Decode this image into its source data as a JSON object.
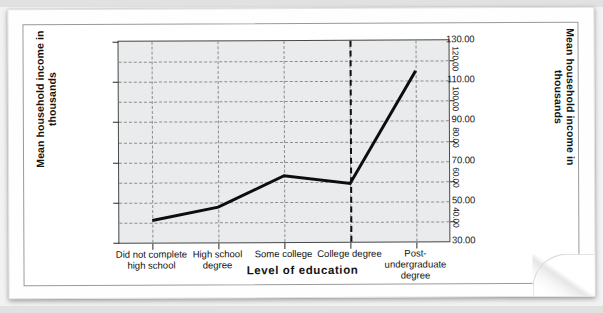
{
  "figure": {
    "x_axis_title": "Level of education",
    "y_axis_title_left": "Mean household income in\nthousands",
    "y_axis_title_right": "Mean household income in\nthousands"
  },
  "chart_data": {
    "type": "line",
    "title": "",
    "xlabel": "Level of education",
    "ylabel": "Mean household income in thousands",
    "categories": [
      "Did not complete\nhigh school",
      "High school\ndegree",
      "Some college",
      "College degree",
      "Post-\nundergraduate\ndegree"
    ],
    "values": [
      41.0,
      47.5,
      63.0,
      59.0,
      115.0
    ],
    "ylim": [
      30,
      130
    ],
    "yticks": [
      30,
      50,
      70,
      90,
      110,
      130
    ],
    "ytick_labels": [
      "30.00",
      "50.00",
      "70.00",
      "90.00",
      "110.00",
      "130.00"
    ],
    "y_minor_gridlines": [
      40,
      60,
      80,
      100,
      120
    ],
    "right_axis": {
      "ticks": [
        40,
        60,
        80,
        100,
        120
      ],
      "tick_labels": [
        "40.00",
        "60.00",
        "80.00",
        "100.00",
        "120.00"
      ],
      "label": "Mean household income in thousands"
    },
    "grid": true,
    "legend": "none",
    "annotations": [
      {
        "type": "vertical-reference-line",
        "at_category": "College degree",
        "style": "dashed"
      }
    ],
    "colors": {
      "line": "#0d0d0d",
      "plot_background": "#e9ebec",
      "gridline": "#8d8d8d",
      "axis": "#4a4a4a"
    }
  }
}
